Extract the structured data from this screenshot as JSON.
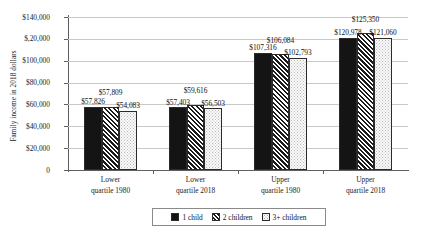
{
  "chart_data": {
    "type": "bar",
    "title": "",
    "subtitle": "",
    "xlabel": "",
    "ylabel": "Family income in 2018 dollars",
    "categories": [
      "Lower quartile 1980",
      "Lower quartile 2018",
      "Upper quartile 1980",
      "Upper quartile 2018"
    ],
    "category_lines": [
      [
        "Lower",
        "quartile 1980"
      ],
      [
        "Lower",
        "quartile 2018"
      ],
      [
        "Upper",
        "quartile 1980"
      ],
      [
        "Upper",
        "quartile 2018"
      ]
    ],
    "series": [
      {
        "name": "1 child",
        "pattern": "solid-black",
        "values": [
          57826,
          57403,
          107316,
          120978
        ],
        "value_labels": [
          "$57,826",
          "$57,403",
          "$107,316",
          "$120,978"
        ]
      },
      {
        "name": "2 children",
        "pattern": "diagonal-hatch",
        "values": [
          57809,
          59616,
          106084,
          125350
        ],
        "value_labels": [
          "$57,809",
          "$59,616",
          "$106,084",
          "$125,350"
        ]
      },
      {
        "name": "3+ children",
        "pattern": "light-dots",
        "values": [
          54083,
          56503,
          102793,
          121060
        ],
        "value_labels": [
          "$54,083",
          "$56,503",
          "$102,793",
          "$121,060"
        ]
      }
    ],
    "ylim": [
      0,
      140000
    ],
    "ytick_values": [
      0,
      20000,
      40000,
      60000,
      80000,
      100000,
      120000,
      140000
    ],
    "ytick_labels": [
      "0",
      "$20,000",
      "$40,000",
      "$60,000",
      "$80,000",
      "$100,000",
      "$,20,000",
      "$140,000"
    ],
    "grid": "horizontal",
    "legend_position": "bottom",
    "colors": {
      "series_1_child": "#141414",
      "series_2_children": "#1b1b1b",
      "series_3plus_children": "#fbfbfb",
      "gridline": "#c9c9c9",
      "axis": "#5f5f5f",
      "background": "#ffffff"
    }
  },
  "legend": {
    "entries": [
      {
        "label": "1 child"
      },
      {
        "label": "2 children"
      },
      {
        "label": "3+ children"
      }
    ]
  }
}
